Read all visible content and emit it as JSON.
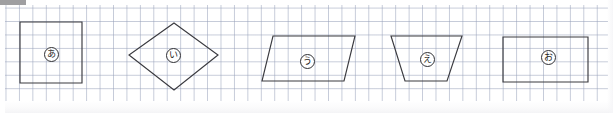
{
  "worksheet": {
    "title": "Geometric figures on graph paper",
    "canvas": {
      "width": 613,
      "height": 113
    },
    "background_color": "#ffffff",
    "grid": {
      "line_color": "#96a0b9",
      "cell_size_px": 13.45,
      "origin": {
        "x": 5,
        "y": 5
      },
      "size": {
        "width": 603,
        "height": 96
      },
      "visible": true
    },
    "artifact": {
      "name": "scan-edge-artifact",
      "color": "#8e8e90"
    },
    "stroke_color": "#3a3a3f",
    "shapes": [
      {
        "id": "shape-a",
        "label": "あ",
        "kind": "square",
        "points": "20,22 82,22 82,83 20,83",
        "label_pos": {
          "x": 44,
          "y": 47
        }
      },
      {
        "id": "shape-i",
        "label": "い",
        "kind": "rhombus",
        "points": "174,23 218,55 174,90 129,55",
        "label_pos": {
          "x": 166,
          "y": 48
        }
      },
      {
        "id": "shape-u",
        "label": "う",
        "kind": "parallelogram",
        "points": "273,36 355,36 344,81 262,81",
        "label_pos": {
          "x": 300,
          "y": 54
        }
      },
      {
        "id": "shape-e",
        "label": "え",
        "kind": "trapezoid",
        "points": "391,36 462,36 447,81 405,81",
        "label_pos": {
          "x": 420,
          "y": 52
        }
      },
      {
        "id": "shape-o",
        "label": "お",
        "kind": "rectangle",
        "points": "503,37 588,37 588,82 503,82",
        "label_pos": {
          "x": 541,
          "y": 50
        }
      }
    ]
  }
}
